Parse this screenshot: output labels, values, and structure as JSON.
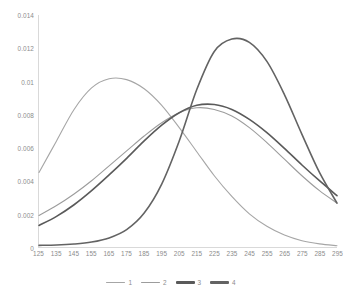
{
  "chart_data": {
    "type": "line",
    "title": "",
    "xlabel": "",
    "ylabel": "",
    "xlim": [
      125,
      295
    ],
    "ylim": [
      0,
      0.014
    ],
    "grid": false,
    "legend_position": "bottom",
    "x_tick_labels": [
      "125",
      "135",
      "145",
      "155",
      "165",
      "175",
      "185",
      "195",
      "205",
      "215",
      "225",
      "235",
      "245",
      "255",
      "265",
      "275",
      "285",
      "295"
    ],
    "y_tick_labels": [
      "0.014",
      "0.012",
      "0.01",
      "0.008",
      "0.006",
      "0.004",
      "0.002",
      "0"
    ],
    "y_tick_values": [
      0.014,
      0.012,
      0.01,
      0.008,
      0.006,
      0.004,
      0.002,
      0
    ],
    "x": [
      125,
      135,
      145,
      155,
      165,
      175,
      185,
      195,
      205,
      215,
      225,
      235,
      245,
      255,
      265,
      275,
      285,
      295
    ],
    "series": [
      {
        "name": "1",
        "color": "#a6a6a6",
        "width": 1.1,
        "values": [
          0.0045,
          0.0064,
          0.0083,
          0.0096,
          0.01015,
          0.0101,
          0.00955,
          0.00855,
          0.0072,
          0.00575,
          0.0043,
          0.00305,
          0.002,
          0.00125,
          0.00072,
          0.00038,
          0.00019,
          8e-05
        ]
      },
      {
        "name": "2",
        "color": "#9c9c9c",
        "width": 1.1,
        "values": [
          0.0019,
          0.0025,
          0.0032,
          0.004,
          0.0049,
          0.0058,
          0.0067,
          0.0075,
          0.0081,
          0.0084,
          0.0083,
          0.0079,
          0.0072,
          0.0063,
          0.0053,
          0.0043,
          0.0034,
          0.00265
        ]
      },
      {
        "name": "3",
        "color": "#5a5a5a",
        "width": 1.6,
        "values": [
          0.0013,
          0.00185,
          0.00255,
          0.0034,
          0.00435,
          0.00535,
          0.0064,
          0.00735,
          0.0081,
          0.00855,
          0.0086,
          0.0083,
          0.0077,
          0.0069,
          0.00595,
          0.00495,
          0.004,
          0.0031
        ]
      },
      {
        "name": "4",
        "color": "#636363",
        "width": 1.6,
        "values": [
          0.0001,
          0.00012,
          0.00018,
          0.0003,
          0.00055,
          0.00105,
          0.00205,
          0.0038,
          0.0064,
          0.0095,
          0.0118,
          0.01255,
          0.01235,
          0.0112,
          0.0092,
          0.0068,
          0.0045,
          0.00265
        ]
      }
    ]
  }
}
